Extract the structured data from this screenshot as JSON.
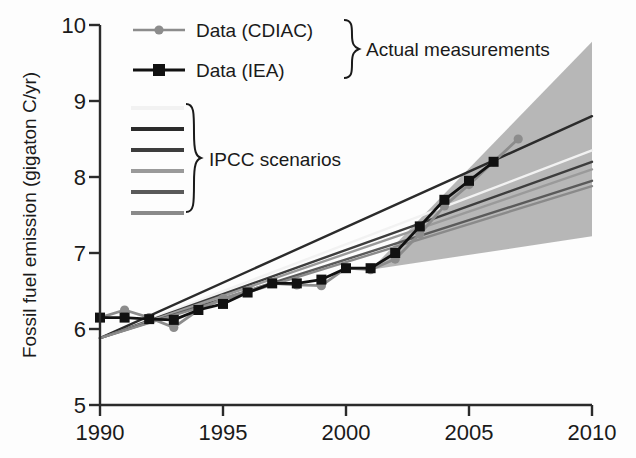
{
  "chart_data": {
    "type": "line",
    "title": "",
    "xlabel": "",
    "ylabel": "Fossil fuel emission (gigaton C/yr)",
    "xlim": [
      1990,
      2010
    ],
    "ylim": [
      5,
      10
    ],
    "xticks": [
      1990,
      1995,
      2000,
      2005,
      2010
    ],
    "xticklabels": [
      "1990",
      "1995",
      "2000",
      "2005",
      "2010"
    ],
    "yticks": [
      5,
      6,
      7,
      8,
      9,
      10
    ],
    "yticklabels": [
      "5",
      "6",
      "7",
      "8",
      "9",
      "10"
    ],
    "grid": false,
    "legend_position": "upper-left-inside",
    "series": [
      {
        "name": "Data (CDIAC)",
        "kind": "line-markers",
        "marker": "circle",
        "color": "#8c8c8c",
        "x": [
          1990,
          1991,
          1992,
          1993,
          1994,
          1995,
          1996,
          1997,
          1998,
          1999,
          2000,
          2001,
          2002,
          2003,
          2004,
          2005,
          2006,
          2007
        ],
        "values": [
          6.15,
          6.25,
          6.15,
          6.02,
          6.25,
          6.4,
          6.5,
          6.6,
          6.58,
          6.57,
          6.8,
          6.78,
          6.92,
          7.25,
          7.62,
          7.9,
          8.2,
          8.5
        ]
      },
      {
        "name": "Data (IEA)",
        "kind": "line-markers",
        "marker": "square",
        "color": "#111111",
        "x": [
          1990,
          1991,
          1992,
          1993,
          1994,
          1995,
          1996,
          1997,
          1998,
          1999,
          2000,
          2001,
          2002,
          2003,
          2004,
          2005,
          2006
        ],
        "values": [
          6.15,
          6.15,
          6.13,
          6.12,
          6.25,
          6.33,
          6.48,
          6.6,
          6.6,
          6.65,
          6.8,
          6.8,
          7.0,
          7.35,
          7.7,
          7.95,
          8.2
        ]
      },
      {
        "name": "IPCC scenario 1",
        "kind": "line",
        "color": "#f2f2f2",
        "x": [
          1990,
          2010
        ],
        "values": [
          5.88,
          8.35
        ]
      },
      {
        "name": "IPCC scenario 2",
        "kind": "line",
        "color": "#2b2b2b",
        "x": [
          1990,
          2010
        ],
        "values": [
          5.88,
          8.8
        ]
      },
      {
        "name": "IPCC scenario 3",
        "kind": "line",
        "color": "#3d3d3d",
        "x": [
          1990,
          2010
        ],
        "values": [
          5.88,
          8.2
        ]
      },
      {
        "name": "IPCC scenario 4",
        "kind": "line",
        "color": "#9a9a9a",
        "x": [
          1990,
          2010
        ],
        "values": [
          5.88,
          8.1
        ]
      },
      {
        "name": "IPCC scenario 5",
        "kind": "line",
        "color": "#5a5a5a",
        "x": [
          1990,
          2010
        ],
        "values": [
          5.88,
          7.95
        ]
      },
      {
        "name": "IPCC scenario 6",
        "kind": "line",
        "color": "#8a8a8a",
        "x": [
          1990,
          2010
        ],
        "values": [
          5.88,
          7.88
        ]
      }
    ],
    "uncertainty_band": {
      "name": "IPCC scenario range",
      "color": "#b3b3b3",
      "x": [
        2001,
        2010
      ],
      "upper": [
        6.78,
        9.78
      ],
      "lower": [
        6.78,
        7.22
      ]
    },
    "annotations": [
      {
        "name": "actual-measurements",
        "text": "Actual measurements"
      },
      {
        "name": "ipcc-scenarios",
        "text": "IPCC scenarios"
      }
    ]
  },
  "legend": {
    "entries": [
      {
        "label": "Data (CDIAC)",
        "marker": "circle",
        "color": "#8c8c8c"
      },
      {
        "label": "Data (IEA)",
        "marker": "square",
        "color": "#111111"
      }
    ],
    "brace_actual": "Actual measurements",
    "brace_scenarios": "IPCC scenarios",
    "scenario_swatches": [
      "#f2f2f2",
      "#2b2b2b",
      "#3d3d3d",
      "#9a9a9a",
      "#5a5a5a",
      "#8a8a8a"
    ]
  },
  "axes": {
    "y_title": "Fossil fuel emission (gigaton C/yr)",
    "y_ticks": [
      "10",
      "9",
      "8",
      "7",
      "6",
      "5"
    ],
    "x_ticks": [
      "1990",
      "1995",
      "2000",
      "2005",
      "2010"
    ]
  },
  "colors": {
    "band": "#b3b3b3",
    "axis": "#2b2b2b",
    "cdiac": "#8c8c8c",
    "iea": "#111111",
    "text": "#1a1a1a"
  }
}
